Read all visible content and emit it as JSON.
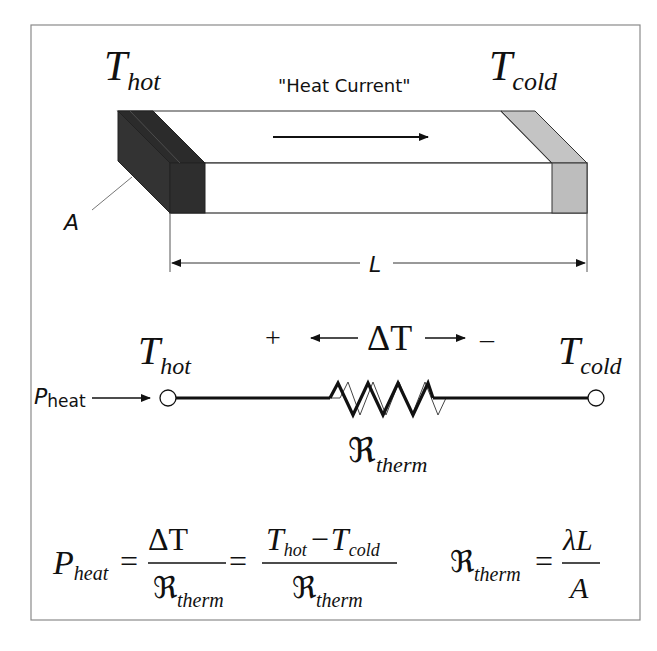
{
  "bar_diagram": {
    "t_hot": {
      "main": "T",
      "sub": "hot"
    },
    "t_cold": {
      "main": "T",
      "sub": "cold"
    },
    "heat_current_label": "\"Heat Current\"",
    "area_label": "A",
    "length_label": "L",
    "colors": {
      "hot_end": "#2b2b2b",
      "cold_end": "#bdbdbd",
      "outline": "#333333"
    }
  },
  "circuit": {
    "t_hot": {
      "main": "T",
      "sub": "hot"
    },
    "t_cold": {
      "main": "T",
      "sub": "cold"
    },
    "plus": "+",
    "minus": "–",
    "delta_t": "ΔT",
    "p_heat": {
      "main": "P",
      "sub": "heat"
    },
    "resistor": {
      "main": "ℜ",
      "sub": "therm"
    }
  },
  "equations": {
    "p_heat": {
      "main": "P",
      "sub": "heat"
    },
    "equals": "=",
    "frac1": {
      "num": "ΔT",
      "den_main": "ℜ",
      "den_sub": "therm"
    },
    "frac2": {
      "num_t1": "T",
      "num_t1_sub": "hot",
      "minus": "−",
      "num_t2": "T",
      "num_t2_sub": "cold",
      "den_main": "ℜ",
      "den_sub": "therm"
    },
    "r_therm": {
      "main": "ℜ",
      "sub": "therm"
    },
    "frac3": {
      "num": "λL",
      "den": "A"
    }
  }
}
